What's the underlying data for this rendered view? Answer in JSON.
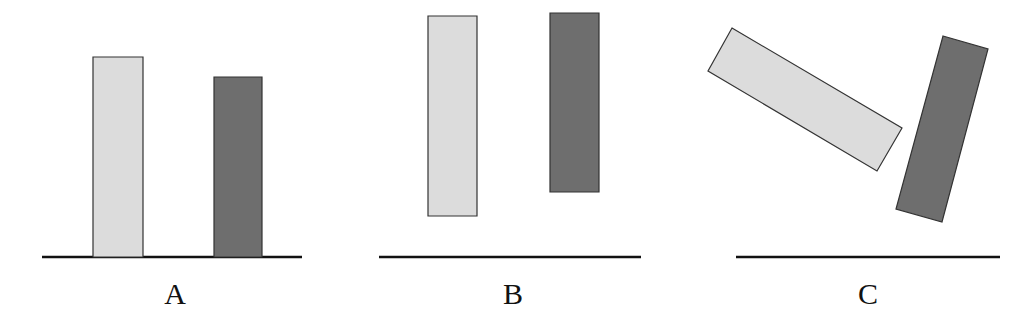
{
  "colors": {
    "light_bar": "#dcdcdc",
    "dark_bar": "#6e6e6e",
    "outline": "#333333",
    "baseline": "#111111",
    "background": "#ffffff"
  },
  "panels": [
    {
      "label": "A",
      "description": "Two upright bars standing on the baseline",
      "baseline": {
        "x1": 42,
        "x2": 302,
        "y": 257
      },
      "light_bar": [
        [
          93,
          57
        ],
        [
          143,
          57
        ],
        [
          143,
          257
        ],
        [
          93,
          257
        ]
      ],
      "dark_bar": [
        [
          214,
          77
        ],
        [
          262,
          77
        ],
        [
          262,
          257
        ],
        [
          214,
          257
        ]
      ],
      "label_x": 175
    },
    {
      "label": "B",
      "description": "Two upright bars floating above the baseline",
      "baseline": {
        "x1": 379,
        "x2": 641,
        "y": 257
      },
      "light_bar": [
        [
          428,
          16
        ],
        [
          477,
          16
        ],
        [
          477,
          216
        ],
        [
          428,
          216
        ]
      ],
      "dark_bar": [
        [
          550,
          13
        ],
        [
          599,
          13
        ],
        [
          599,
          192
        ],
        [
          550,
          192
        ]
      ],
      "label_x": 513
    },
    {
      "label": "C",
      "description": "Two tilted bars floating above the baseline",
      "baseline": {
        "x1": 736,
        "x2": 1000,
        "y": 257
      },
      "light_bar": [
        [
          732,
          28
        ],
        [
          902,
          128
        ],
        [
          877,
          171
        ],
        [
          708,
          71
        ]
      ],
      "dark_bar": [
        [
          943,
          36
        ],
        [
          988,
          49
        ],
        [
          942,
          222
        ],
        [
          896,
          209
        ]
      ],
      "label_x": 868
    }
  ]
}
